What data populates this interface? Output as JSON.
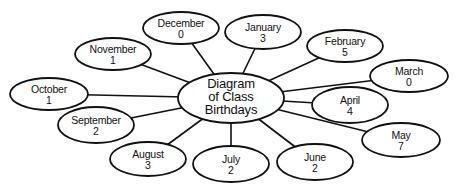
{
  "diagram": {
    "center": {
      "lines": [
        "Diagram",
        "of Class",
        "Birthdays"
      ],
      "cx": 231,
      "cy": 98,
      "rx": 53,
      "ry": 25
    },
    "nodes": [
      {
        "month": "January",
        "count": "3",
        "cx": 263,
        "cy": 32,
        "rx": 38,
        "ry": 17
      },
      {
        "month": "February",
        "count": "5",
        "cx": 345,
        "cy": 46,
        "rx": 38,
        "ry": 16
      },
      {
        "month": "March",
        "count": "0",
        "cx": 409,
        "cy": 76,
        "rx": 39,
        "ry": 16
      },
      {
        "month": "April",
        "count": "4",
        "cx": 350,
        "cy": 105,
        "rx": 38,
        "ry": 18
      },
      {
        "month": "May",
        "count": "7",
        "cx": 401,
        "cy": 140,
        "rx": 39,
        "ry": 17
      },
      {
        "month": "June",
        "count": "2",
        "cx": 315,
        "cy": 162,
        "rx": 38,
        "ry": 18
      },
      {
        "month": "July",
        "count": "2",
        "cx": 231,
        "cy": 164,
        "rx": 38,
        "ry": 18
      },
      {
        "month": "August",
        "count": "3",
        "cx": 148,
        "cy": 159,
        "rx": 38,
        "ry": 17
      },
      {
        "month": "September",
        "count": "2",
        "cx": 96,
        "cy": 125,
        "rx": 38,
        "ry": 18
      },
      {
        "month": "October",
        "count": "1",
        "cx": 49,
        "cy": 94,
        "rx": 39,
        "ry": 16
      },
      {
        "month": "November",
        "count": "1",
        "cx": 113,
        "cy": 54,
        "rx": 38,
        "ry": 16
      },
      {
        "month": "December",
        "count": "0",
        "cx": 181,
        "cy": 28,
        "rx": 38,
        "ry": 16
      }
    ]
  }
}
